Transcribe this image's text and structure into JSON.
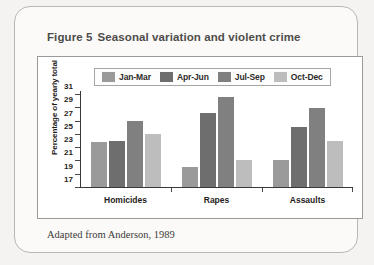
{
  "figure": {
    "number": "Figure 5",
    "title": "Seasonal variation and violent crime",
    "caption": "Adapted from Anderson, 1989"
  },
  "chart_data": {
    "type": "bar",
    "title": "Seasonal variation and violent crime",
    "xlabel": "",
    "ylabel": "Percentage of yearly total",
    "ylim": [
      17,
      31
    ],
    "yticks": [
      17,
      19,
      21,
      23,
      25,
      27,
      29,
      31
    ],
    "grid": false,
    "legend_position": "top",
    "categories": [
      "Homicides",
      "Rapes",
      "Assaults"
    ],
    "series": [
      {
        "name": "Jan-Mar",
        "color": "#9a9a9a",
        "values": [
          23.9,
          20.1,
          21.1
        ]
      },
      {
        "name": "Apr-Jun",
        "color": "#6e6e6e",
        "values": [
          24.0,
          28.2,
          26.1
        ]
      },
      {
        "name": "Jul-Sep",
        "color": "#808080",
        "values": [
          27.1,
          30.7,
          29.1
        ]
      },
      {
        "name": "Oct-Dec",
        "color": "#bdbdbd",
        "values": [
          25.0,
          21.1,
          24.0
        ]
      }
    ]
  }
}
